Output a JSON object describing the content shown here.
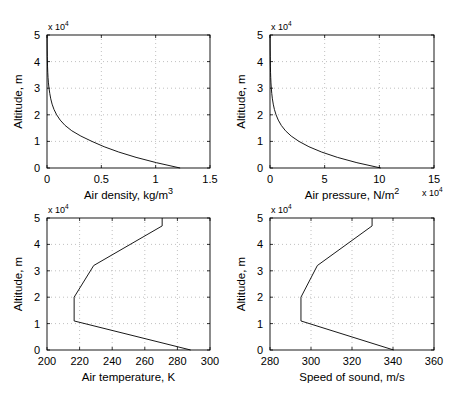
{
  "chart_data": [
    {
      "type": "line",
      "id": "density",
      "box": {
        "x0": 47,
        "x1": 210,
        "y0": 35,
        "y1": 168
      },
      "xlabel": "Air density, kg/m",
      "xlabel_sup": "3",
      "ylabel": "Altitude, m",
      "y_multiplier": "x 10",
      "y_multiplier_exp": "4",
      "x_multiplier": "",
      "x_multiplier_exp": "",
      "xlim": [
        0,
        1.5
      ],
      "ylim": [
        0,
        50000
      ],
      "xticks": [
        0,
        0.5,
        1,
        1.5
      ],
      "xtick_labels": [
        "0",
        "0.5",
        "1",
        "1.5"
      ],
      "yticks": [
        0,
        10000,
        20000,
        30000,
        40000,
        50000
      ],
      "ytick_labels": [
        "0",
        "1",
        "2",
        "3",
        "4",
        "5"
      ],
      "grid": true,
      "x": [
        1.225,
        1.007,
        0.8194,
        0.6601,
        0.5258,
        0.4135,
        0.3119,
        0.2279,
        0.1665,
        0.1216,
        0.0889,
        0.0645,
        0.0469,
        0.0346,
        0.0257,
        0.0184,
        0.0132,
        0.0096,
        0.007,
        0.0051,
        0.004,
        0.0028,
        0.002,
        0.0014,
        0.001
      ],
      "y": [
        0,
        2000,
        4000,
        6000,
        8000,
        10000,
        12000,
        14000,
        16000,
        18000,
        20000,
        22000,
        24000,
        26000,
        28000,
        30000,
        32000,
        34000,
        36000,
        38000,
        40000,
        42000,
        44000,
        47000,
        50000
      ]
    },
    {
      "type": "line",
      "id": "pressure",
      "box": {
        "x0": 270,
        "x1": 434,
        "y0": 35,
        "y1": 168
      },
      "xlabel": "Air pressure, N/m",
      "xlabel_sup": "2",
      "ylabel": "Altitude, m",
      "y_multiplier": "x 10",
      "y_multiplier_exp": "4",
      "x_multiplier": "x 10",
      "x_multiplier_exp": "4",
      "xlim": [
        0,
        150000
      ],
      "ylim": [
        0,
        50000
      ],
      "xticks": [
        0,
        50000,
        100000,
        150000
      ],
      "xtick_labels": [
        "0",
        "5",
        "10",
        "15"
      ],
      "yticks": [
        0,
        10000,
        20000,
        30000,
        40000,
        50000
      ],
      "ytick_labels": [
        "0",
        "1",
        "2",
        "3",
        "4",
        "5"
      ],
      "grid": true,
      "x": [
        101325,
        79495,
        61640,
        47181,
        35600,
        26500,
        19399,
        14170,
        10353,
        7565,
        5529,
        4047,
        2972,
        2188,
        1616,
        1197,
        889,
        663,
        498,
        377,
        287,
        220,
        169,
        111,
        80
      ],
      "y": [
        0,
        2000,
        4000,
        6000,
        8000,
        10000,
        12000,
        14000,
        16000,
        18000,
        20000,
        22000,
        24000,
        26000,
        28000,
        30000,
        32000,
        34000,
        36000,
        38000,
        40000,
        42000,
        44000,
        47000,
        50000
      ]
    },
    {
      "type": "line",
      "id": "temperature",
      "box": {
        "x0": 47,
        "x1": 210,
        "y0": 218,
        "y1": 350
      },
      "xlabel": "Air temperature, K",
      "xlabel_sup": "",
      "ylabel": "Altitude, m",
      "y_multiplier": "x 10",
      "y_multiplier_exp": "4",
      "x_multiplier": "",
      "x_multiplier_exp": "",
      "xlim": [
        200,
        300
      ],
      "ylim": [
        0,
        50000
      ],
      "xticks": [
        200,
        220,
        240,
        260,
        280,
        300
      ],
      "xtick_labels": [
        "200",
        "220",
        "240",
        "260",
        "280",
        "300"
      ],
      "yticks": [
        0,
        10000,
        20000,
        30000,
        40000,
        50000
      ],
      "ytick_labels": [
        "0",
        "1",
        "2",
        "3",
        "4",
        "5"
      ],
      "grid": true,
      "x": [
        288.15,
        216.65,
        216.65,
        228.65,
        270.65,
        270.65
      ],
      "y": [
        0,
        11000,
        20000,
        32000,
        47000,
        50000
      ]
    },
    {
      "type": "line",
      "id": "sound_speed",
      "box": {
        "x0": 270,
        "x1": 434,
        "y0": 218,
        "y1": 350
      },
      "xlabel": "Speed of sound, m/s",
      "xlabel_sup": "",
      "ylabel": "Altitude, m",
      "y_multiplier": "x 10",
      "y_multiplier_exp": "4",
      "x_multiplier": "",
      "x_multiplier_exp": "",
      "xlim": [
        280,
        360
      ],
      "ylim": [
        0,
        50000
      ],
      "xticks": [
        280,
        300,
        320,
        340,
        360
      ],
      "xtick_labels": [
        "280",
        "300",
        "320",
        "340",
        "360"
      ],
      "yticks": [
        0,
        10000,
        20000,
        30000,
        40000,
        50000
      ],
      "ytick_labels": [
        "0",
        "1",
        "2",
        "3",
        "4",
        "5"
      ],
      "grid": true,
      "x": [
        340.3,
        295.1,
        295.1,
        303.1,
        329.8,
        329.8
      ],
      "y": [
        0,
        11000,
        20000,
        32000,
        47000,
        50000
      ]
    }
  ]
}
